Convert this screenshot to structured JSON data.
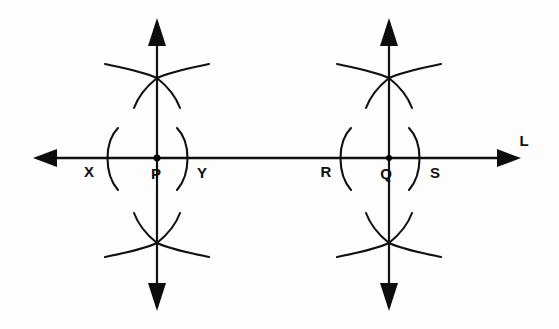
{
  "figure": {
    "background_color": "#fdfdfd",
    "ink_color": "#111111",
    "canvas": {
      "width": 559,
      "height": 329
    }
  },
  "line": {
    "name": "horizontal-line",
    "label": "L",
    "label_position": {
      "x": 527,
      "y": 145
    },
    "y": 158,
    "x_start": 35,
    "x_end": 520,
    "left_arrow": {
      "tip_x": 33,
      "tip_y": 158
    },
    "right_arrow": {
      "tip_x": 521,
      "tip_y": 158
    }
  },
  "points": [
    {
      "id": "X",
      "label": "X",
      "x": 96,
      "y": 158,
      "label_x": 89,
      "label_y": 175,
      "dot": false
    },
    {
      "id": "P",
      "label": "P",
      "x": 157,
      "y": 158,
      "label_x": 152,
      "label_y": 177,
      "dot": true
    },
    {
      "id": "Y",
      "label": "Y",
      "x": 196,
      "y": 158,
      "label_x": 196,
      "label_y": 177,
      "dot": false
    },
    {
      "id": "R",
      "label": "R",
      "x": 330,
      "y": 158,
      "label_x": 326,
      "label_y": 175,
      "dot": false
    },
    {
      "id": "Q",
      "label": "Q",
      "x": 389,
      "y": 158,
      "label_x": 381,
      "label_y": 177,
      "dot": true
    },
    {
      "id": "S",
      "label": "S",
      "x": 430,
      "y": 158,
      "label_x": 430,
      "label_y": 177,
      "dot": false
    }
  ],
  "perpendiculars": [
    {
      "name": "perpendicular-at-P",
      "x": 157,
      "top_y": 18,
      "bottom_y": 311,
      "top_arrow_tip_y": 18,
      "bottom_arrow_tip_y": 311
    },
    {
      "name": "perpendicular-at-Q",
      "x": 389,
      "top_y": 18,
      "bottom_y": 311,
      "top_arrow_tip_y": 18,
      "bottom_arrow_tip_y": 311
    }
  ],
  "side_arcs": [
    {
      "name": "arc-left-of-P",
      "cx": 157,
      "cy": 158,
      "r": 52,
      "side": "left",
      "x": 108
    },
    {
      "name": "arc-right-of-P",
      "cx": 157,
      "cy": 158,
      "r": 52,
      "side": "right",
      "x": 186
    },
    {
      "name": "arc-left-of-Q",
      "cx": 389,
      "cy": 158,
      "r": 52,
      "side": "left",
      "x": 341
    },
    {
      "name": "arc-right-of-Q",
      "cx": 389,
      "cy": 158,
      "r": 52,
      "side": "right",
      "x": 419
    }
  ],
  "intersection_arcs": [
    {
      "name": "wide-arc-upper-left-P",
      "center": "Y",
      "cluster": "P",
      "position": "above"
    },
    {
      "name": "wide-arc-upper-right-P",
      "center": "X",
      "cluster": "P",
      "position": "above"
    },
    {
      "name": "small-arc-upper-left-P",
      "center": "Y",
      "cluster": "P",
      "position": "above"
    },
    {
      "name": "small-arc-upper-right-P",
      "center": "X",
      "cluster": "P",
      "position": "above"
    },
    {
      "name": "wide-arc-lower-left-P",
      "center": "Y",
      "cluster": "P",
      "position": "below"
    },
    {
      "name": "wide-arc-lower-right-P",
      "center": "X",
      "cluster": "P",
      "position": "below"
    },
    {
      "name": "small-arc-lower-left-P",
      "center": "Y",
      "cluster": "P",
      "position": "below"
    },
    {
      "name": "small-arc-lower-right-P",
      "center": "X",
      "cluster": "P",
      "position": "below"
    },
    {
      "name": "wide-arc-upper-left-Q",
      "center": "S",
      "cluster": "Q",
      "position": "above"
    },
    {
      "name": "wide-arc-upper-right-Q",
      "center": "R",
      "cluster": "Q",
      "position": "above"
    },
    {
      "name": "small-arc-upper-left-Q",
      "center": "S",
      "cluster": "Q",
      "position": "above"
    },
    {
      "name": "small-arc-upper-right-Q",
      "center": "R",
      "cluster": "Q",
      "position": "above"
    },
    {
      "name": "wide-arc-lower-left-Q",
      "center": "S",
      "cluster": "Q",
      "position": "below"
    },
    {
      "name": "wide-arc-lower-right-Q",
      "center": "R",
      "cluster": "Q",
      "position": "below"
    },
    {
      "name": "small-arc-lower-left-Q",
      "center": "S",
      "cluster": "Q",
      "position": "below"
    },
    {
      "name": "small-arc-lower-right-Q",
      "center": "R",
      "cluster": "Q",
      "position": "below"
    }
  ],
  "intersection_nodes": [
    {
      "name": "upper-intersection-P",
      "x": 157,
      "y": 78
    },
    {
      "name": "lower-intersection-P",
      "x": 157,
      "y": 243
    },
    {
      "name": "upper-intersection-Q",
      "x": 389,
      "y": 78
    },
    {
      "name": "lower-intersection-Q",
      "x": 389,
      "y": 243
    }
  ]
}
